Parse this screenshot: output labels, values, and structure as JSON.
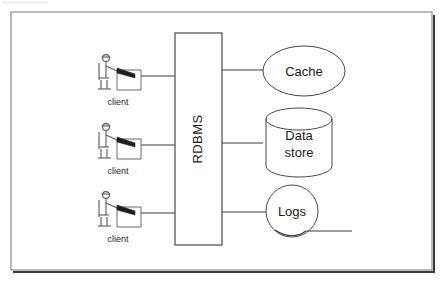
{
  "diagram": {
    "background_color": "#ffffff",
    "frame": {
      "name": "diagram-frame",
      "border_color": "#8c8c8c",
      "shadow_color": "#3a3a3a"
    },
    "central_node": {
      "label": "RDBMS",
      "shape": "rectangle",
      "orientation": "vertical-text",
      "stroke_color": "#4a4a4a"
    },
    "clients": [
      {
        "label": "client",
        "icon": "user-at-workstation-icon"
      },
      {
        "label": "client",
        "icon": "user-at-workstation-icon"
      },
      {
        "label": "client",
        "icon": "user-at-workstation-icon"
      }
    ],
    "backends": [
      {
        "label": "Cache",
        "shape": "ellipse",
        "icon": "cache-ellipse-icon"
      },
      {
        "label_line1": "Data",
        "label_line2": "store",
        "shape": "cylinder",
        "icon": "database-cylinder-icon"
      },
      {
        "label": "Logs",
        "shape": "circle-with-tail",
        "icon": "logs-circle-icon"
      }
    ],
    "connectors": {
      "client_to_rdbms_count": 3,
      "rdbms_to_backend_count": 3,
      "stroke_color": "#3d3d3d"
    }
  }
}
